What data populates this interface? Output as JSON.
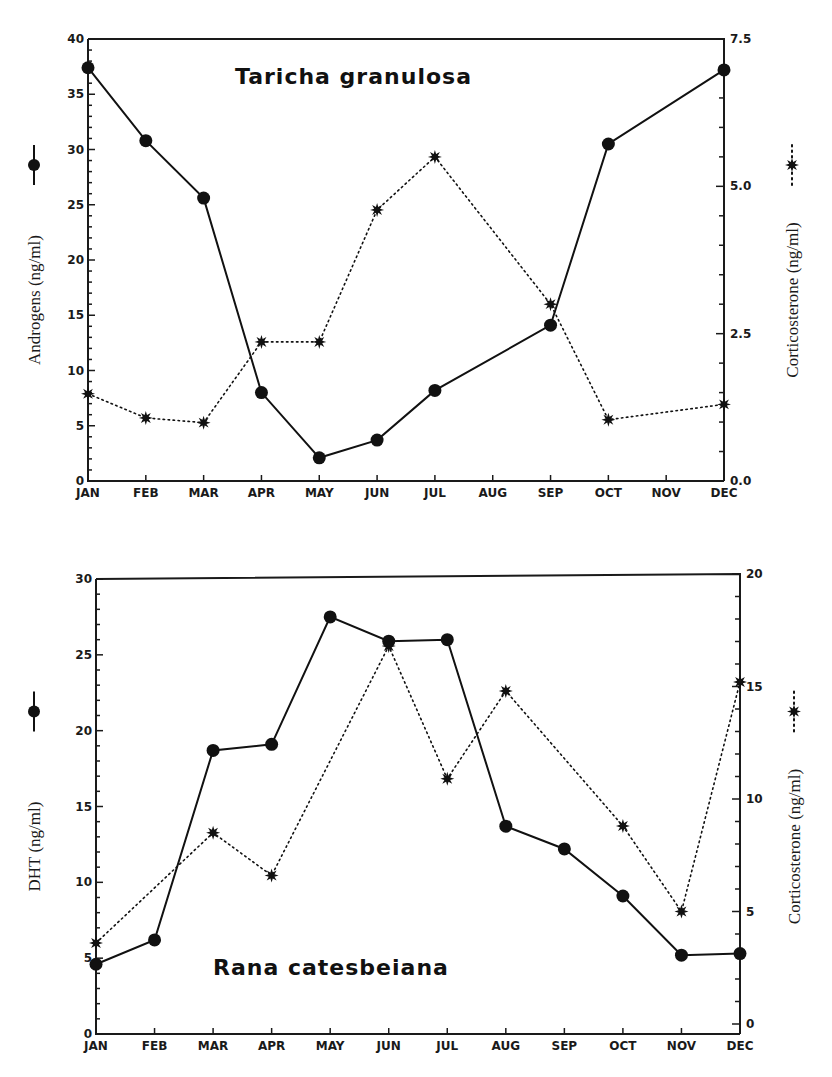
{
  "chart_data": [
    {
      "type": "line",
      "title": "Taricha granulosa",
      "categories": [
        "JAN",
        "FEB",
        "MAR",
        "APR",
        "MAY",
        "JUN",
        "JUL",
        "AUG",
        "SEP",
        "OCT",
        "NOV",
        "DEC"
      ],
      "ylabel": "Androgens (ng/ml)",
      "ylabel_right": "Corticosterone (ng/ml)",
      "ylim": [
        0,
        40
      ],
      "ylim_right": [
        0,
        7.5
      ],
      "yticks": [
        0,
        5,
        10,
        15,
        20,
        25,
        30,
        35,
        40
      ],
      "yticks_right": [
        "0.0",
        "2.5",
        "5.0",
        "7.5"
      ],
      "series": [
        {
          "name": "Androgens",
          "axis": "left",
          "marker": "circle",
          "line": "solid",
          "values": [
            37.4,
            30.8,
            25.6,
            8.0,
            2.1,
            3.7,
            8.2,
            null,
            14.1,
            30.5,
            null,
            37.2
          ]
        },
        {
          "name": "Corticosterone",
          "axis": "right",
          "marker": "star",
          "line": "dotted",
          "values": [
            1.48,
            1.07,
            0.99,
            2.36,
            2.36,
            4.6,
            5.5,
            null,
            3.0,
            1.04,
            null,
            1.3
          ]
        }
      ]
    },
    {
      "type": "line",
      "title": "Rana catesbeiana",
      "categories": [
        "JAN",
        "FEB",
        "MAR",
        "APR",
        "MAY",
        "JUN",
        "JUL",
        "AUG",
        "SEP",
        "OCT",
        "NOV",
        "DEC"
      ],
      "ylabel": "DHT (ng/ml)",
      "ylabel_right": "Corticosterone (ng/ml)",
      "ylim": [
        0,
        30
      ],
      "ylim_right": [
        0,
        20
      ],
      "yticks": [
        0,
        5,
        10,
        15,
        20,
        25,
        30
      ],
      "yticks_right": [
        "0",
        "5",
        "10",
        "15",
        "20"
      ],
      "series": [
        {
          "name": "DHT",
          "axis": "left",
          "marker": "circle",
          "line": "solid",
          "values": [
            4.6,
            6.2,
            18.7,
            19.1,
            27.5,
            25.9,
            26.0,
            13.7,
            12.2,
            9.1,
            5.2,
            5.3
          ]
        },
        {
          "name": "Corticosterone",
          "axis": "right",
          "marker": "star",
          "line": "dotted",
          "values": [
            3.6,
            null,
            8.5,
            6.6,
            null,
            16.8,
            10.9,
            14.8,
            null,
            8.8,
            5.0,
            15.2
          ]
        }
      ]
    }
  ],
  "panels": [
    {
      "x0": 88,
      "x1": 724,
      "yTop": 39,
      "yBot": 481,
      "titleX": 235,
      "titleY": 84,
      "ylabelX": 40,
      "rlabelX": 798
    },
    {
      "x0": 96,
      "x1": 740,
      "yTop": 579,
      "yBot": 1034,
      "yTopR": 574,
      "yBotR": 1024,
      "titleX": 213,
      "titleY": 975,
      "ylabelX": 40,
      "rlabelX": 800
    }
  ]
}
